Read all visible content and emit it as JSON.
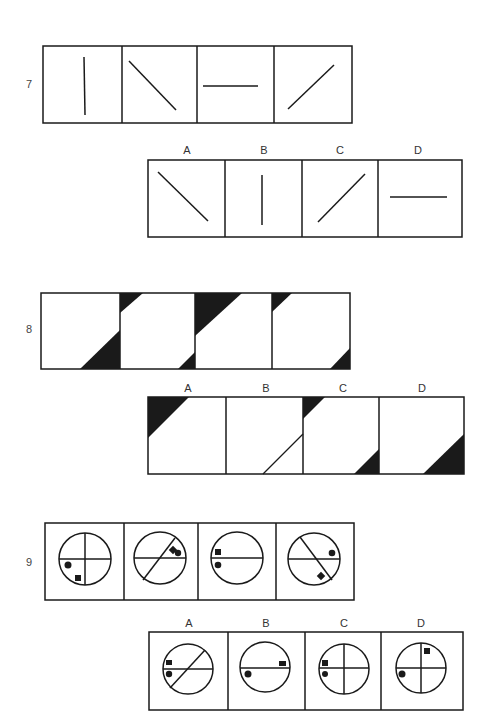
{
  "questions": [
    {
      "number": "7",
      "sequence": [
        {
          "figure": "vertical-line"
        },
        {
          "figure": "diagonal-line-backslash"
        },
        {
          "figure": "horizontal-line"
        },
        {
          "figure": "diagonal-line-slash"
        }
      ],
      "options": [
        {
          "label": "A",
          "figure": "diagonal-line-backslash"
        },
        {
          "label": "B",
          "figure": "vertical-line"
        },
        {
          "label": "C",
          "figure": "diagonal-line-slash"
        },
        {
          "label": "D",
          "figure": "horizontal-line"
        }
      ]
    },
    {
      "number": "8",
      "sequence": [
        {
          "figure": "bottom-right-large-black-triangle"
        },
        {
          "figure": "top-left-small-and-bottom-right-small-triangles"
        },
        {
          "figure": "top-left-large-black-triangle"
        },
        {
          "figure": "top-left-small-and-bottom-right-small-triangles"
        }
      ],
      "options": [
        {
          "label": "A",
          "figure": "top-left-large-black-triangle"
        },
        {
          "label": "B",
          "figure": "bottom-right-outlined-triangle"
        },
        {
          "label": "C",
          "figure": "top-left-small-and-bottom-right-small-triangles"
        },
        {
          "label": "D",
          "figure": "bottom-right-large-black-triangle"
        }
      ]
    },
    {
      "number": "9",
      "sequence": [
        {
          "figure": "circle-cross-dot-square-lower-left"
        },
        {
          "figure": "circle-horizontal-slash-dot-diamond-upper-right"
        },
        {
          "figure": "circle-horizontal-square-dot-left"
        },
        {
          "figure": "circle-horizontal-backslash-dot-right-diamond-lower"
        }
      ],
      "options": [
        {
          "label": "A",
          "figure": "circle-horizontal-slash-square-dot-left"
        },
        {
          "label": "B",
          "figure": "circle-horizontal-dot-left-square-right"
        },
        {
          "label": "C",
          "figure": "circle-cross-square-dot-left"
        },
        {
          "label": "D",
          "figure": "circle-cross-dot-left-square-top"
        }
      ]
    }
  ],
  "colors": {
    "ink": "#1a1a1a",
    "paper": "#ffffff"
  }
}
